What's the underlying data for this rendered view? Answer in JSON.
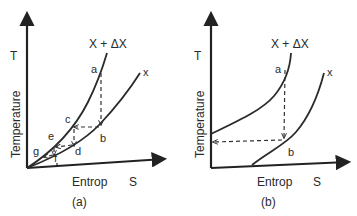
{
  "panels": [
    {
      "id": "a",
      "caption": "(a)",
      "y_axis": {
        "symbol": "T",
        "label": "Temperature"
      },
      "x_axis": {
        "symbol": "S",
        "label": "Entrop"
      },
      "curves": [
        {
          "name": "upper-curve",
          "label": "X + ΔX"
        },
        {
          "name": "lower-curve",
          "label": "x"
        }
      ],
      "points": [
        "a",
        "b",
        "c",
        "d",
        "e",
        "f",
        "g"
      ]
    },
    {
      "id": "b",
      "caption": "(b)",
      "y_axis": {
        "symbol": "T",
        "label": "Temperature"
      },
      "x_axis": {
        "symbol": "S",
        "label": "Entrop"
      },
      "curves": [
        {
          "name": "upper-curve",
          "label": "X + ΔX"
        },
        {
          "name": "lower-curve",
          "label": "x"
        }
      ],
      "points": [
        "a",
        "b"
      ]
    }
  ]
}
